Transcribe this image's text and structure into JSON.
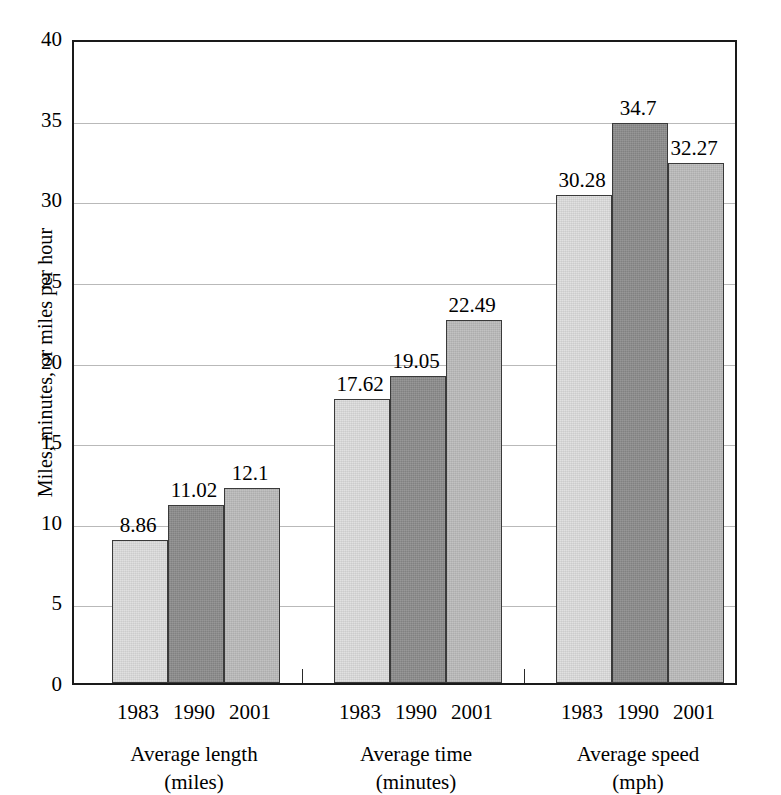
{
  "chart_data": {
    "type": "bar",
    "title": "",
    "subtitle": "",
    "xlabel": "",
    "ylabel": "Miles, minutes, or miles per hour",
    "ylim": [
      0,
      40
    ],
    "ytick_labels": [
      "0",
      "5",
      "10",
      "15",
      "20",
      "25",
      "30",
      "35",
      "40"
    ],
    "ytick_values": [
      0,
      5,
      10,
      15,
      20,
      25,
      30,
      35,
      40
    ],
    "grid": true,
    "legend": "none",
    "categories": [
      "1983",
      "1990",
      "2001"
    ],
    "groups": [
      {
        "name": "Average length",
        "unit": "(miles)",
        "caption_line1": "Average length",
        "caption_line2": "(miles)",
        "bars": [
          {
            "category": "1983",
            "value": 8.86,
            "label": "8.86"
          },
          {
            "category": "1990",
            "value": 11.02,
            "label": "11.02"
          },
          {
            "category": "2001",
            "value": 12.1,
            "label": "12.1"
          }
        ]
      },
      {
        "name": "Average time",
        "unit": "(minutes)",
        "caption_line1": "Average time",
        "caption_line2": "(minutes)",
        "bars": [
          {
            "category": "1983",
            "value": 17.62,
            "label": "17.62"
          },
          {
            "category": "1990",
            "value": 19.05,
            "label": "19.05"
          },
          {
            "category": "2001",
            "value": 22.49,
            "label": "22.49"
          }
        ]
      },
      {
        "name": "Average speed",
        "unit": "(mph)",
        "caption_line1": "Average speed",
        "caption_line2": "(mph)",
        "bars": [
          {
            "category": "1983",
            "value": 30.28,
            "label": "30.28"
          },
          {
            "category": "1990",
            "value": 34.7,
            "label": "34.7"
          },
          {
            "category": "2001",
            "value": 32.27,
            "label": "32.27"
          }
        ]
      }
    ],
    "series": [
      {
        "name": "1983",
        "values": [
          8.86,
          17.62,
          30.28
        ],
        "color": "#dedede"
      },
      {
        "name": "1990",
        "values": [
          11.02,
          19.05,
          34.7
        ],
        "color": "#8d8d8d"
      },
      {
        "name": "2001",
        "values": [
          12.1,
          22.49,
          32.27
        ],
        "color": "#bcbcbc"
      }
    ]
  },
  "colors": {
    "series_1983": "#dedede",
    "series_1990": "#8d8d8d",
    "series_2001": "#bcbcbc",
    "axis": "#1a1a1a",
    "gridline": "#b9b9b9",
    "background": "#ffffff",
    "text": "#000000"
  }
}
